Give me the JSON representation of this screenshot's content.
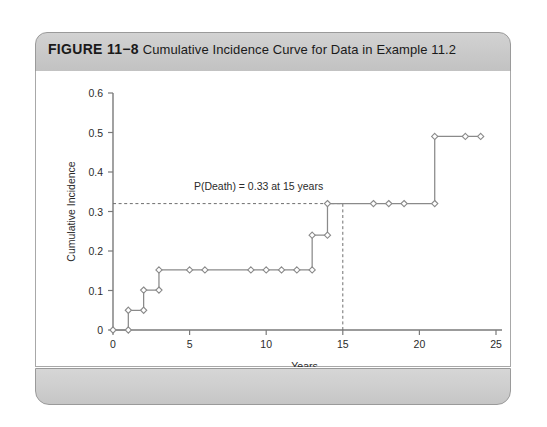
{
  "figure": {
    "number_label": "FIGURE 11−8",
    "caption": "Cumulative Incidence Curve for Data in Example 11.2"
  },
  "chart_data": {
    "type": "line",
    "subtype": "step",
    "title": "Cumulative Incidence Curve for Data in Example 11.2",
    "xlabel": "Years",
    "ylabel": "Cumulative Incidence",
    "xlim": [
      0,
      25
    ],
    "ylim": [
      0,
      0.6
    ],
    "xticks": [
      0,
      5,
      10,
      15,
      20,
      25
    ],
    "xtick_labels": [
      "0",
      "5",
      "10",
      "15",
      "20",
      "25"
    ],
    "yticks": [
      0,
      0.1,
      0.2,
      0.3,
      0.4,
      0.5,
      0.6
    ],
    "ytick_labels": [
      "0",
      "0.1",
      "0.2",
      "0.3",
      "0.4",
      "0.5",
      "0.6"
    ],
    "grid": false,
    "legend": null,
    "series": [
      {
        "name": "Cumulative Incidence",
        "step": "post",
        "points": [
          {
            "x": 0,
            "y": 0.0
          },
          {
            "x": 1,
            "y": 0.0
          },
          {
            "x": 1,
            "y": 0.05
          },
          {
            "x": 2,
            "y": 0.05
          },
          {
            "x": 2,
            "y": 0.101
          },
          {
            "x": 3,
            "y": 0.101
          },
          {
            "x": 3,
            "y": 0.152
          },
          {
            "x": 5,
            "y": 0.152
          },
          {
            "x": 6,
            "y": 0.152
          },
          {
            "x": 9,
            "y": 0.152
          },
          {
            "x": 10,
            "y": 0.152
          },
          {
            "x": 11,
            "y": 0.152
          },
          {
            "x": 12,
            "y": 0.152
          },
          {
            "x": 13,
            "y": 0.152
          },
          {
            "x": 13,
            "y": 0.24
          },
          {
            "x": 14,
            "y": 0.24
          },
          {
            "x": 14,
            "y": 0.32
          },
          {
            "x": 17,
            "y": 0.32
          },
          {
            "x": 18,
            "y": 0.32
          },
          {
            "x": 19,
            "y": 0.32
          },
          {
            "x": 21,
            "y": 0.32
          },
          {
            "x": 21,
            "y": 0.49
          },
          {
            "x": 23,
            "y": 0.49
          },
          {
            "x": 24,
            "y": 0.49
          }
        ]
      }
    ],
    "annotations": [
      {
        "name": "p-death-annotation",
        "text": "P(Death) = 0.33 at 15 years",
        "x": 9.5,
        "y": 0.355
      }
    ],
    "reference_lines": [
      {
        "name": "horizontal-reference-line",
        "orientation": "horizontal",
        "value": 0.32,
        "x_from": 0,
        "x_to": 15,
        "style": "dashed"
      },
      {
        "name": "vertical-reference-line",
        "orientation": "vertical",
        "value": 15,
        "y_from": 0,
        "y_to": 0.32,
        "style": "dashed"
      }
    ],
    "colors": {
      "line": "#8a8a8a",
      "marker_fill": "#ffffff",
      "axis": "#7a7a7a",
      "text": "#2b2b2b",
      "reference": "#6f6f6f"
    }
  }
}
